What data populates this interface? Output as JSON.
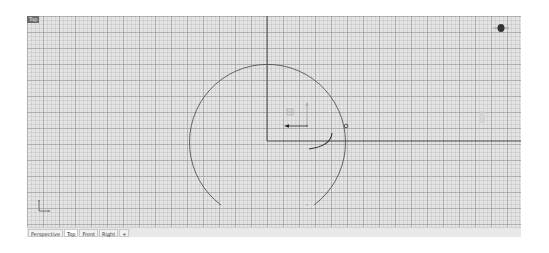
{
  "viewport": {
    "label": "Top",
    "grid": {
      "minor_spacing_px": 4,
      "major_spacing_px": 16,
      "background": "#e4e4e4"
    },
    "axis_color": "#3a3a3a",
    "curve_color": "#444444"
  },
  "tabs": [
    {
      "label": "Perspective",
      "active": false
    },
    {
      "label": "Top",
      "active": true
    },
    {
      "label": "Front",
      "active": false
    },
    {
      "label": "Right",
      "active": false
    },
    {
      "label": "+",
      "active": false
    }
  ],
  "icons": {
    "navigation": "compass-icon",
    "axes": "world-axes-icon",
    "gumball": "gumball-widget",
    "control_point": "control-point-icon"
  }
}
